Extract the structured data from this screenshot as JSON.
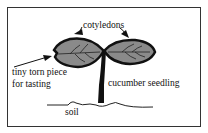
{
  "diagram": {
    "labels": {
      "cotyledons": "cotyledons",
      "torn_piece_line1": "tiny torn piece",
      "torn_piece_line2": "for tasting",
      "seedling": "cucumber seedling",
      "soil": "soil"
    },
    "colors": {
      "leaf_fill": "#8a8a8a",
      "outline": "#111111",
      "border": "#333333"
    }
  }
}
